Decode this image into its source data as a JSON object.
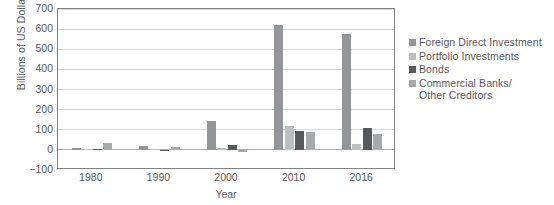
{
  "chart_data": {
    "type": "bar",
    "title": "",
    "subtitle": "",
    "xlabel": "Year",
    "ylabel": "Billions of US Dollars",
    "categories": [
      "1980",
      "1990",
      "2000",
      "2010",
      "2016"
    ],
    "ylim": [
      -100,
      700
    ],
    "yticks": [
      -100,
      0,
      100,
      200,
      300,
      400,
      500,
      600,
      700
    ],
    "ytick_labels": [
      "−100",
      "0",
      "100",
      "200",
      "300",
      "400",
      "500",
      "600",
      "700"
    ],
    "grid": "horizontal",
    "legend_position": "right",
    "series": [
      {
        "name": "Foreign Direct Investment",
        "color": "#939598",
        "values": [
          8,
          18,
          145,
          620,
          575
        ]
      },
      {
        "name": "Portfolio Investments",
        "color": "#bcbec0",
        "values": [
          3,
          2,
          10,
          118,
          28
        ]
      },
      {
        "name": "Bonds",
        "color": "#58595b",
        "values": [
          2,
          -5,
          24,
          95,
          108
        ]
      },
      {
        "name": "Commercial Banks/\nOther Creditors",
        "color": "#a7a9ac",
        "values": [
          32,
          12,
          -12,
          88,
          78
        ]
      }
    ]
  },
  "axis": {
    "frame_color": "#808285",
    "grid_color": "#d6d7d9",
    "zero_line_color": "#a7a9ac",
    "text_color": "#58595b"
  }
}
